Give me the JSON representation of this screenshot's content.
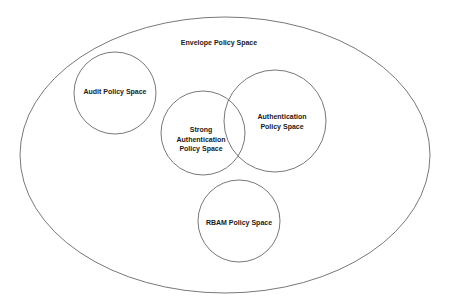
{
  "diagram": {
    "type": "venn-nested",
    "stroke_color": "#555555",
    "background": "#ffffff",
    "envelope": {
      "label": "Envelope Policy Space",
      "shape": "ellipse"
    },
    "spaces": [
      {
        "id": "audit",
        "lines": [
          "Audit Policy Space"
        ]
      },
      {
        "id": "strong-authentication",
        "lines": [
          "Strong",
          "Authentication",
          "Policy Space"
        ]
      },
      {
        "id": "authentication",
        "lines": [
          "Authentication",
          "Policy Space"
        ]
      },
      {
        "id": "rbam",
        "lines": [
          "RBAM Policy Space"
        ]
      }
    ],
    "relationships": [
      {
        "from": "strong-authentication",
        "to": "authentication",
        "type": "overlap"
      }
    ]
  }
}
